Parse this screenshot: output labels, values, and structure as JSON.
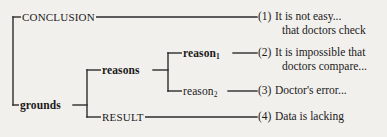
{
  "diagram": {
    "background_color": "#f2f0ed",
    "line_color": "#2b2b2b",
    "nodes": {
      "conclusion": "CONCLUSION",
      "grounds": "grounds",
      "reasons": "reasons",
      "result": "RESULT",
      "reason1_base": "reason",
      "reason1_sub": "1",
      "reason2_base": "reason",
      "reason2_sub": "2"
    },
    "leaves": [
      {
        "number": "(1)",
        "line1": "It is not easy...",
        "line2": "that doctors check"
      },
      {
        "number": "(2)",
        "line1": "It is impossible that",
        "line2": "doctors compare..."
      },
      {
        "number": "(3)",
        "line1": "Doctor's error...",
        "line2": ""
      },
      {
        "number": "(4)",
        "line1": "Data is lacking",
        "line2": ""
      }
    ]
  }
}
